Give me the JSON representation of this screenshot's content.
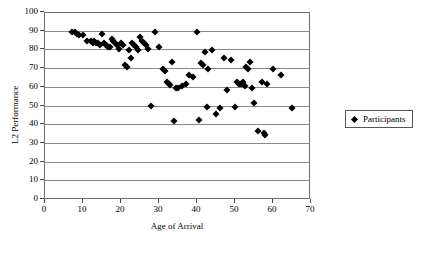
{
  "chart_data": {
    "type": "scatter",
    "title": "",
    "xlabel": "Age of Arrival",
    "ylabel": "L2 Performance",
    "xlim": [
      0,
      70
    ],
    "ylim": [
      0,
      100
    ],
    "xticks": [
      0,
      10,
      20,
      30,
      40,
      50,
      60,
      70
    ],
    "yticks": [
      0,
      10,
      20,
      30,
      40,
      50,
      60,
      70,
      80,
      90,
      100
    ],
    "grid": "horizontal",
    "legend_position": "right",
    "marker": "diamond",
    "marker_color": "#000000",
    "series": [
      {
        "name": "Participants",
        "points": [
          [
            7,
            90
          ],
          [
            8,
            90
          ],
          [
            8.5,
            89
          ],
          [
            9,
            88
          ],
          [
            10,
            88
          ],
          [
            11,
            85
          ],
          [
            12,
            85
          ],
          [
            12.5,
            84
          ],
          [
            13,
            85
          ],
          [
            13.5,
            84
          ],
          [
            14,
            84
          ],
          [
            14.5,
            83
          ],
          [
            15,
            89
          ],
          [
            15.5,
            84
          ],
          [
            16,
            83
          ],
          [
            16.5,
            82
          ],
          [
            17,
            82
          ],
          [
            17.5,
            86
          ],
          [
            18,
            85
          ],
          [
            18.5,
            84
          ],
          [
            19,
            83
          ],
          [
            19.5,
            81
          ],
          [
            20,
            84
          ],
          [
            20.5,
            83
          ],
          [
            21,
            72
          ],
          [
            21.5,
            71
          ],
          [
            22,
            80
          ],
          [
            22.5,
            76
          ],
          [
            23,
            84
          ],
          [
            23.5,
            83
          ],
          [
            24,
            82
          ],
          [
            24.5,
            80
          ],
          [
            25,
            87
          ],
          [
            25.5,
            85
          ],
          [
            26,
            84
          ],
          [
            26.5,
            83
          ],
          [
            27,
            81
          ],
          [
            28,
            50.5
          ],
          [
            29,
            90
          ],
          [
            30,
            82
          ],
          [
            31,
            70
          ],
          [
            31.5,
            69
          ],
          [
            32,
            63
          ],
          [
            32.5,
            62
          ],
          [
            33,
            61.5
          ],
          [
            33.5,
            74
          ],
          [
            34,
            42
          ],
          [
            34.5,
            60
          ],
          [
            35,
            60
          ],
          [
            36,
            61
          ],
          [
            37,
            62
          ],
          [
            38,
            67
          ],
          [
            39,
            66
          ],
          [
            40,
            90
          ],
          [
            40.5,
            43
          ],
          [
            41,
            73
          ],
          [
            41.5,
            72
          ],
          [
            42,
            79
          ],
          [
            42.5,
            50
          ],
          [
            43,
            70
          ],
          [
            44,
            80
          ],
          [
            45,
            46
          ],
          [
            46,
            49
          ],
          [
            47,
            76
          ],
          [
            48,
            59
          ],
          [
            49,
            75
          ],
          [
            50,
            50
          ],
          [
            50.5,
            63
          ],
          [
            51,
            62
          ],
          [
            51.5,
            62
          ],
          [
            52,
            63
          ],
          [
            52.5,
            61
          ],
          [
            53,
            71
          ],
          [
            53.5,
            70
          ],
          [
            54,
            74
          ],
          [
            54.5,
            60
          ],
          [
            55,
            52
          ],
          [
            56,
            37
          ],
          [
            57,
            63
          ],
          [
            57.5,
            36
          ],
          [
            58,
            35
          ],
          [
            58.5,
            62
          ],
          [
            60,
            70
          ],
          [
            62,
            67
          ],
          [
            65,
            49
          ]
        ]
      }
    ]
  },
  "legend": {
    "entries": [
      {
        "label": "Participants"
      }
    ]
  },
  "axes": {
    "x_title": "Age of Arrival",
    "y_title": "L2 Performance",
    "x_tick_labels": [
      "0",
      "10",
      "20",
      "30",
      "40",
      "50",
      "60",
      "70"
    ],
    "y_tick_labels": [
      "0",
      "10",
      "20",
      "30",
      "40",
      "50",
      "60",
      "70",
      "80",
      "90",
      "100"
    ]
  }
}
